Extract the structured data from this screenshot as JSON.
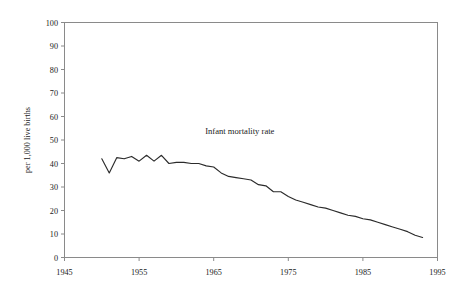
{
  "chart_data": {
    "type": "line",
    "title": "",
    "xlabel": "",
    "ylabel": "per 1,000 live births",
    "annotation": "Infant mortality rate",
    "series_name": "Infant mortality rate",
    "xlim": [
      1945,
      1995
    ],
    "ylim": [
      0,
      100
    ],
    "xticks": [
      1945,
      1955,
      1965,
      1975,
      1985,
      1995
    ],
    "yticks": [
      0,
      10,
      20,
      30,
      40,
      50,
      60,
      70,
      80,
      90,
      100
    ],
    "xtick_labels": [
      "1945",
      "1955",
      "1965",
      "1975",
      "1985",
      "1995"
    ],
    "ytick_labels": [
      "0",
      "10",
      "20",
      "30",
      "40",
      "50",
      "60",
      "70",
      "80",
      "90",
      "100"
    ],
    "grid": false,
    "legend": "none",
    "line_color": "#2b2b2b",
    "frame_color": "#8a8a8a",
    "x": [
      1950,
      1951,
      1952,
      1953,
      1954,
      1955,
      1956,
      1957,
      1958,
      1959,
      1960,
      1961,
      1962,
      1963,
      1964,
      1965,
      1966,
      1967,
      1968,
      1969,
      1970,
      1971,
      1972,
      1973,
      1974,
      1975,
      1976,
      1977,
      1978,
      1979,
      1980,
      1981,
      1982,
      1983,
      1984,
      1985,
      1986,
      1987,
      1988,
      1989,
      1990,
      1991,
      1992,
      1993
    ],
    "values": [
      42.0,
      36.0,
      42.5,
      42.0,
      43.0,
      41.0,
      43.5,
      41.0,
      43.5,
      40.0,
      40.5,
      40.5,
      40.0,
      40.0,
      39.0,
      38.5,
      36.0,
      34.5,
      34.0,
      33.5,
      33.0,
      31.0,
      30.5,
      28.0,
      28.0,
      26.0,
      24.5,
      23.5,
      22.5,
      21.5,
      21.0,
      20.0,
      19.0,
      18.0,
      17.5,
      16.5,
      16.0,
      15.0,
      14.0,
      13.0,
      12.0,
      11.0,
      9.5,
      8.5
    ]
  }
}
